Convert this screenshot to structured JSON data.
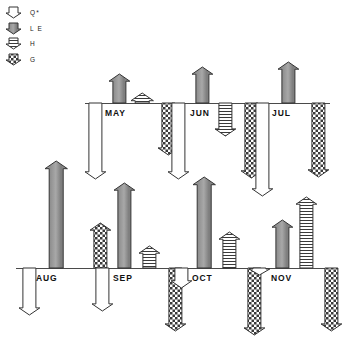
{
  "figure": {
    "title": ""
  },
  "legend": {
    "name": "flux-legend",
    "items": [
      {
        "key": "Qstar",
        "label": "Q*",
        "fill": "white",
        "fill_hex": "#ffffff",
        "symbol": "down-pennant-open"
      },
      {
        "key": "LE",
        "label": "L E",
        "fill": "gray",
        "fill_hex": "#8a8a8a",
        "symbol": "down-pennant-gray"
      },
      {
        "key": "H",
        "label": "H",
        "fill": "hatched",
        "fill_hex": "#ffffff",
        "symbol": "down-pennant-hatched"
      },
      {
        "key": "G",
        "label": "G",
        "fill": "checker",
        "fill_hex": "#ffffff",
        "symbol": "down-pennant-checker"
      }
    ]
  },
  "chart_data": {
    "type": "bar",
    "title": "",
    "xlabel": "",
    "ylabel": "",
    "grid": false,
    "legend_position": "top-left",
    "categories": [
      "MAY",
      "JUN",
      "JUL",
      "AUG",
      "SEP",
      "OCT",
      "NOV"
    ],
    "series": [
      {
        "name": "Q*",
        "key": "Qstar",
        "fill": "white",
        "values": [
          -76,
          -76,
          -93,
          -47,
          -43,
          -20,
          -7
        ]
      },
      {
        "name": "L E",
        "key": "LE",
        "fill": "gray",
        "values": [
          29,
          36,
          41,
          107,
          85,
          91,
          48
        ]
      },
      {
        "name": "H",
        "key": "H",
        "fill": "hatched",
        "values": [
          10,
          33,
          0,
          0,
          22,
          36,
          71
        ]
      },
      {
        "name": "G",
        "key": "G",
        "fill": "checker",
        "values": [
          -52,
          -75,
          -74,
          45,
          -63,
          -67,
          -63
        ]
      }
    ]
  },
  "groups": [
    {
      "name": "MAY",
      "label": "MAY",
      "row": "top",
      "left": 85,
      "baseline_y": 103,
      "baseline_w": 112,
      "label_x": 105,
      "label_y": 108,
      "arrows": [
        {
          "key": "Qstar",
          "fill": "white",
          "dir": "down",
          "x": 4,
          "w": 13,
          "len": 76
        },
        {
          "key": "LE",
          "fill": "gray",
          "dir": "up",
          "x": 28,
          "w": 13,
          "len": 29
        },
        {
          "key": "H",
          "fill": "hatched",
          "dir": "up",
          "x": 50,
          "w": 14,
          "len": 10
        },
        {
          "key": "G",
          "fill": "checker",
          "dir": "down",
          "x": 77,
          "w": 13,
          "len": 52
        }
      ]
    },
    {
      "name": "JUN",
      "label": "JUN",
      "row": "top",
      "left": 168,
      "baseline_y": 103,
      "baseline_w": 112,
      "label_x": 190,
      "label_y": 108,
      "arrows": [
        {
          "key": "Qstar",
          "fill": "white",
          "dir": "down",
          "x": 4,
          "w": 13,
          "len": 76
        },
        {
          "key": "LE",
          "fill": "gray",
          "dir": "up",
          "x": 28,
          "w": 13,
          "len": 36
        },
        {
          "key": "H",
          "fill": "hatched",
          "dir": "down",
          "x": 51,
          "w": 13,
          "len": 33
        },
        {
          "key": "G",
          "fill": "checker",
          "dir": "down",
          "x": 77,
          "w": 13,
          "len": 75
        }
      ]
    },
    {
      "name": "JUL",
      "label": "JUL",
      "row": "top",
      "left": 252,
      "baseline_y": 103,
      "baseline_w": 78,
      "label_x": 272,
      "label_y": 108,
      "arrows": [
        {
          "key": "Qstar",
          "fill": "white",
          "dir": "down",
          "x": 4,
          "w": 13,
          "len": 93
        },
        {
          "key": "LE",
          "fill": "gray",
          "dir": "up",
          "x": 30,
          "w": 13,
          "len": 41
        },
        {
          "key": "G",
          "fill": "checker",
          "dir": "down",
          "x": 60,
          "w": 13,
          "len": 74
        }
      ]
    },
    {
      "name": "AUG",
      "label": "AUG",
      "row": "bottom",
      "left": 16,
      "baseline_y": 268,
      "baseline_w": 112,
      "label_x": 36,
      "label_y": 273,
      "arrows": [
        {
          "key": "Qstar",
          "fill": "white",
          "dir": "down",
          "x": 7,
          "w": 13,
          "len": 47
        },
        {
          "key": "LE",
          "fill": "gray",
          "dir": "up",
          "x": 33,
          "w": 14,
          "len": 107
        },
        {
          "key": "G",
          "fill": "checker",
          "dir": "up",
          "x": 78,
          "w": 13,
          "len": 45
        }
      ]
    },
    {
      "name": "SEP",
      "label": "SEP",
      "row": "bottom",
      "left": 93,
      "baseline_y": 268,
      "baseline_w": 110,
      "label_x": 113,
      "label_y": 273,
      "arrows": [
        {
          "key": "Qstar",
          "fill": "white",
          "dir": "down",
          "x": 3,
          "w": 13,
          "len": 43
        },
        {
          "key": "LE",
          "fill": "gray",
          "dir": "up",
          "x": 25,
          "w": 13,
          "len": 85
        },
        {
          "key": "H",
          "fill": "hatched",
          "dir": "up",
          "x": 50,
          "w": 13,
          "len": 22
        },
        {
          "key": "G",
          "fill": "checker",
          "dir": "down",
          "x": 76,
          "w": 13,
          "len": 63
        }
      ]
    },
    {
      "name": "OCT",
      "label": "OCT",
      "row": "bottom",
      "left": 172,
      "baseline_y": 268,
      "baseline_w": 110,
      "label_x": 192,
      "label_y": 273,
      "arrows": [
        {
          "key": "Qstar",
          "fill": "white",
          "dir": "down",
          "x": 3,
          "w": 13,
          "len": 20
        },
        {
          "key": "LE",
          "fill": "gray",
          "dir": "up",
          "x": 25,
          "w": 14,
          "len": 91
        },
        {
          "key": "H",
          "fill": "hatched",
          "dir": "up",
          "x": 51,
          "w": 13,
          "len": 36
        },
        {
          "key": "G",
          "fill": "checker",
          "dir": "down",
          "x": 76,
          "w": 13,
          "len": 67
        }
      ]
    },
    {
      "name": "NOV",
      "label": "NOV",
      "row": "bottom",
      "left": 251,
      "baseline_y": 268,
      "baseline_w": 79,
      "label_x": 271,
      "label_y": 273,
      "arrows": [
        {
          "key": "Qstar",
          "fill": "white",
          "dir": "down",
          "x": 2,
          "w": 13,
          "len": 7
        },
        {
          "key": "LE",
          "fill": "gray",
          "dir": "up",
          "x": 25,
          "w": 13,
          "len": 48
        },
        {
          "key": "H",
          "fill": "hatched",
          "dir": "up",
          "x": 49,
          "w": 13,
          "len": 71
        },
        {
          "key": "G",
          "fill": "checker",
          "dir": "down",
          "x": 74,
          "w": 13,
          "len": 63
        }
      ]
    }
  ]
}
